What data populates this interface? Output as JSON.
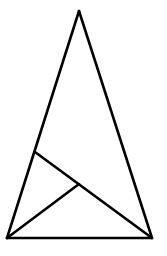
{
  "diagram": {
    "type": "geometry-triangle",
    "stroke_color": "#000000",
    "background": "#ffffff",
    "stroke_width": 2.6,
    "points": {
      "apex": [
        79,
        11
      ],
      "bottom_left": [
        7,
        238
      ],
      "bottom_right": [
        152,
        238
      ],
      "left_side_point": [
        35,
        152
      ],
      "inner_point": [
        79,
        184
      ]
    },
    "segments": [
      {
        "name": "left-side",
        "from": "apex",
        "to": "bottom_left"
      },
      {
        "name": "right-side",
        "from": "apex",
        "to": "bottom_right"
      },
      {
        "name": "base",
        "from": "bottom_left",
        "to": "bottom_right"
      },
      {
        "name": "cevian-from-bottom-right",
        "from": "bottom_right",
        "to": "left_side_point"
      },
      {
        "name": "segment-from-bottom-left",
        "from": "bottom_left",
        "to": "inner_point"
      }
    ]
  }
}
